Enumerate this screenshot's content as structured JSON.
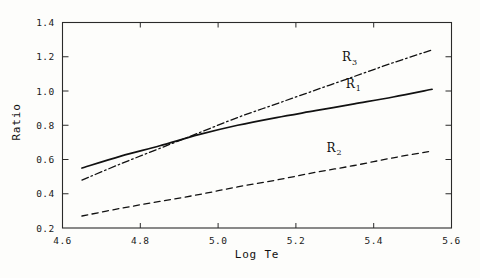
{
  "chart_data": {
    "type": "line",
    "title": "",
    "xlabel": "Log Te",
    "ylabel": "Ratio",
    "xlim": [
      4.6,
      5.6
    ],
    "ylim": [
      0.2,
      1.4
    ],
    "xticks": [
      "4.6",
      "4.8",
      "5.0",
      "5.2",
      "5.4",
      "5.6"
    ],
    "yticks": [
      "0.2",
      "0.4",
      "0.6",
      "0.8",
      "1.0",
      "1.2",
      "1.4"
    ],
    "grid": false,
    "legend_position": "inline-annotations",
    "series": [
      {
        "name": "R1",
        "label": "R",
        "subscript": "1",
        "style": "solid",
        "label_x": 5.34,
        "label_y": 1.02,
        "x": [
          4.65,
          4.75,
          4.85,
          4.95,
          5.05,
          5.15,
          5.25,
          5.35,
          5.45,
          5.55
        ],
        "y": [
          0.55,
          0.62,
          0.68,
          0.745,
          0.8,
          0.845,
          0.885,
          0.925,
          0.965,
          1.01
        ]
      },
      {
        "name": "R2",
        "label": "R",
        "subscript": "2",
        "style": "dashed",
        "label_x": 5.29,
        "label_y": 0.645,
        "x": [
          4.65,
          4.75,
          4.85,
          4.95,
          5.05,
          5.15,
          5.25,
          5.35,
          5.45,
          5.55
        ],
        "y": [
          0.27,
          0.315,
          0.355,
          0.395,
          0.44,
          0.48,
          0.525,
          0.565,
          0.61,
          0.65
        ]
      },
      {
        "name": "R3",
        "label": "R",
        "subscript": "3",
        "style": "dashdot",
        "label_x": 5.33,
        "label_y": 1.175,
        "x": [
          4.65,
          4.75,
          4.85,
          4.95,
          5.05,
          5.15,
          5.25,
          5.35,
          5.45,
          5.55
        ],
        "y": [
          0.48,
          0.575,
          0.665,
          0.755,
          0.845,
          0.925,
          1.005,
          1.085,
          1.165,
          1.24
        ]
      }
    ]
  }
}
